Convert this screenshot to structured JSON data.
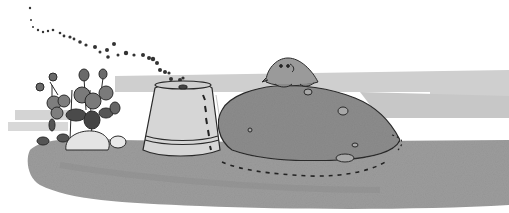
{
  "illustration": {
    "style": "grayscale ink-and-wash drawing",
    "subjects": [
      "ant trail",
      "flowering plant",
      "rocks",
      "upturned flower pot",
      "dirt mound",
      "mole"
    ],
    "colors": {
      "background": "#ffffff",
      "ground": "#9a9a9a",
      "ground_light": "#c4c4c4",
      "mound": "#8a8a8a",
      "pot": "#d8d8d8",
      "ink": "#2a2a2a",
      "leaf": "#6e6e6e",
      "rock": "#e6e6e6"
    }
  }
}
